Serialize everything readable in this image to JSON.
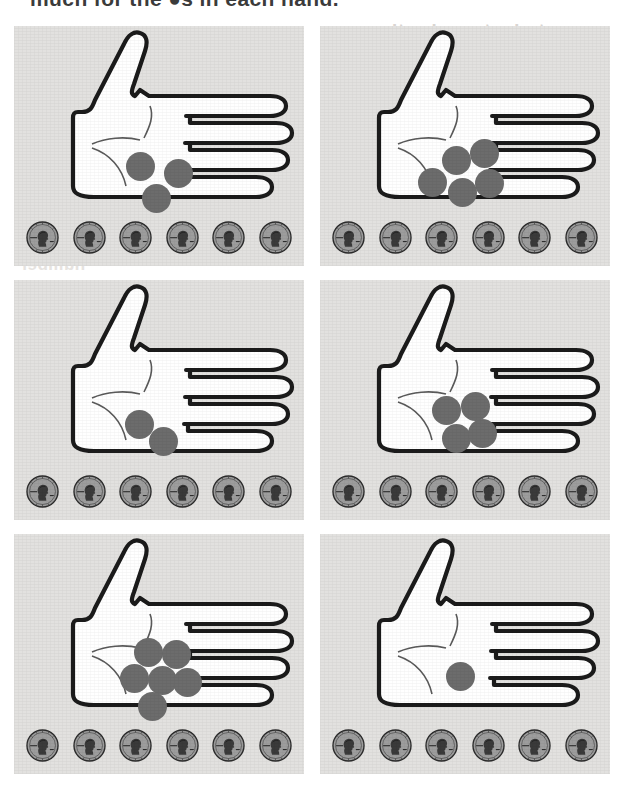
{
  "page": {
    "instruction_text": "much for the ●s in each hand.",
    "background_color": "#ffffff",
    "panel_color": "#e2e1df",
    "dot_color": "#6c6c6c",
    "ink_color": "#1a1a1a",
    "coin_color": "#9a9a9a"
  },
  "bleed_through": [
    {
      "text": "students resize the ones"
    },
    {
      "text": "the circle the answer."
    },
    {
      "text": "number"
    }
  ],
  "worksheet": {
    "columns": 2,
    "rows": 3,
    "pennies_per_panel": 6,
    "coin_name": "penny",
    "panels": [
      {
        "index": 1,
        "label": "hand-panel-1",
        "dot_count": 3,
        "penny_count": 6,
        "dots": [
          {
            "x": 112,
            "y": 126
          },
          {
            "x": 150,
            "y": 133
          },
          {
            "x": 128,
            "y": 158
          }
        ]
      },
      {
        "index": 2,
        "label": "hand-panel-2",
        "dot_count": 5,
        "penny_count": 6,
        "dots": [
          {
            "x": 122,
            "y": 120
          },
          {
            "x": 150,
            "y": 113
          },
          {
            "x": 98,
            "y": 142
          },
          {
            "x": 128,
            "y": 152
          },
          {
            "x": 155,
            "y": 143
          }
        ]
      },
      {
        "index": 3,
        "label": "hand-panel-3",
        "dot_count": 2,
        "penny_count": 6,
        "dots": [
          {
            "x": 111,
            "y": 130
          },
          {
            "x": 135,
            "y": 147
          }
        ]
      },
      {
        "index": 4,
        "label": "hand-panel-4",
        "dot_count": 4,
        "penny_count": 6,
        "dots": [
          {
            "x": 112,
            "y": 116
          },
          {
            "x": 141,
            "y": 112
          },
          {
            "x": 122,
            "y": 144
          },
          {
            "x": 148,
            "y": 139
          }
        ]
      },
      {
        "index": 5,
        "label": "hand-panel-5",
        "dot_count": 6,
        "penny_count": 6,
        "dots": [
          {
            "x": 120,
            "y": 104
          },
          {
            "x": 148,
            "y": 106
          },
          {
            "x": 106,
            "y": 130
          },
          {
            "x": 134,
            "y": 132
          },
          {
            "x": 159,
            "y": 134
          },
          {
            "x": 124,
            "y": 158
          }
        ]
      },
      {
        "index": 6,
        "label": "hand-panel-6",
        "dot_count": 1,
        "penny_count": 6,
        "dots": [
          {
            "x": 126,
            "y": 128
          }
        ]
      }
    ]
  }
}
